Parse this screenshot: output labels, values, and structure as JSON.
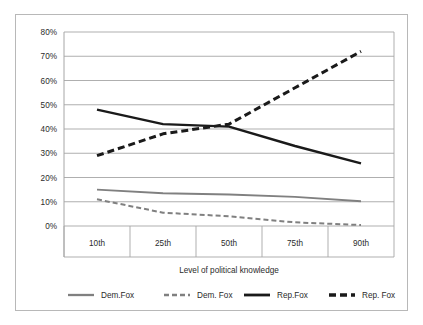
{
  "chart_data": {
    "type": "line",
    "title": "",
    "subtitle": "",
    "xlabel": "Level of political knowledge",
    "ylabel": "",
    "categories": [
      "10th",
      "25th",
      "50th",
      "75th",
      "90th"
    ],
    "ylim": [
      0,
      80
    ],
    "ytick_labels": [
      "0%",
      "10%",
      "20%",
      "30%",
      "40%",
      "50%",
      "60%",
      "70%",
      "80%"
    ],
    "ytick_values": [
      0,
      10,
      20,
      30,
      40,
      50,
      60,
      70,
      80
    ],
    "grid": "horizontal",
    "legend_position": "bottom",
    "series": [
      {
        "name": "Dem.Fox",
        "style": "solid",
        "color": "#808080",
        "values": [
          15.0,
          13.5,
          13.0,
          12.0,
          10.2
        ]
      },
      {
        "name": "Dem. Fox",
        "style": "dashed",
        "color": "#808080",
        "values": [
          11.0,
          5.5,
          4.0,
          1.5,
          0.4
        ]
      },
      {
        "name": "Rep.Fox",
        "style": "solid",
        "color": "#1a1a1a",
        "values": [
          48.0,
          42.0,
          41.0,
          33.0,
          25.8
        ]
      },
      {
        "name": "Rep. Fox",
        "style": "dashed",
        "color": "#1a1a1a",
        "values": [
          29.0,
          38.0,
          42.0,
          57.0,
          72.0
        ]
      }
    ]
  },
  "colors": {
    "frame_border": "#b8b8b8",
    "gridline": "#a6a6a6",
    "axis_line": "#a6a6a6",
    "text": "#2b2b2b",
    "series_gray": "#808080",
    "series_black": "#1a1a1a"
  }
}
